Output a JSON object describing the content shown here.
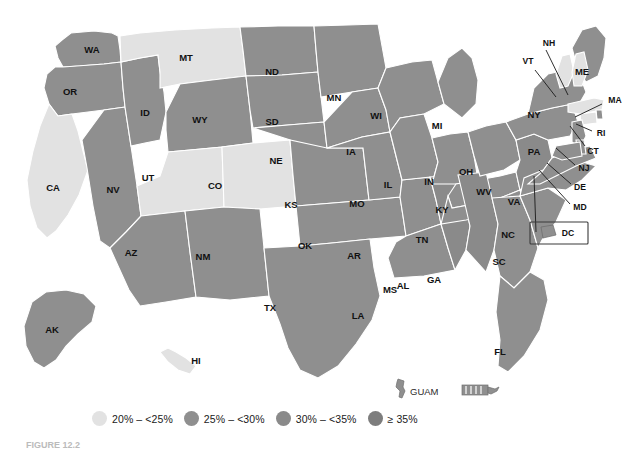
{
  "figure": {
    "type": "choropleth-map",
    "region": "United States",
    "caption": "FIGURE 12.2"
  },
  "legend": {
    "items": [
      {
        "label": "20% – <25%",
        "color": "#e2e2e2",
        "range_min": 20,
        "range_max": 25
      },
      {
        "label": "25% – <30%",
        "color": "#8f8f8f",
        "range_min": 25,
        "range_max": 30
      },
      {
        "label": "30% – <35%",
        "color": "#8a8a8a",
        "range_min": 30,
        "range_max": 35
      },
      {
        "label": "≥ 35%",
        "color": "#7d7d7d",
        "range_min": 35,
        "range_max": null
      }
    ]
  },
  "territories": [
    {
      "code": "GUAM",
      "label": "GUAM",
      "category": 2
    },
    {
      "code": "PR",
      "label": "",
      "category": 2
    }
  ],
  "chart_data": {
    "type": "map",
    "title": "",
    "value_label": "Prevalence",
    "categories": [
      "20% – <25%",
      "25% – <30%",
      "30% – <35%",
      "≥ 35%"
    ],
    "colors": [
      "#e2e2e2",
      "#8f8f8f",
      "#8a8a8a",
      "#7d7d7d"
    ],
    "states": [
      {
        "code": "WA",
        "label": "WA",
        "category": 2
      },
      {
        "code": "OR",
        "label": "OR",
        "category": 2
      },
      {
        "code": "CA",
        "label": "CA",
        "category": 1
      },
      {
        "code": "NV",
        "label": "NV",
        "category": 2
      },
      {
        "code": "ID",
        "label": "ID",
        "category": 2
      },
      {
        "code": "MT",
        "label": "MT",
        "category": 1
      },
      {
        "code": "WY",
        "label": "WY",
        "category": 2
      },
      {
        "code": "UT",
        "label": "UT",
        "category": 1
      },
      {
        "code": "CO",
        "label": "CO",
        "category": 1
      },
      {
        "code": "AZ",
        "label": "AZ",
        "category": 2
      },
      {
        "code": "NM",
        "label": "NM",
        "category": 2
      },
      {
        "code": "ND",
        "label": "ND",
        "category": 2
      },
      {
        "code": "SD",
        "label": "SD",
        "category": 2
      },
      {
        "code": "NE",
        "label": "NE",
        "category": 2
      },
      {
        "code": "KS",
        "label": "KS",
        "category": 2
      },
      {
        "code": "OK",
        "label": "OK",
        "category": 2
      },
      {
        "code": "TX",
        "label": "TX",
        "category": 2
      },
      {
        "code": "MN",
        "label": "MN",
        "category": 2
      },
      {
        "code": "IA",
        "label": "IA",
        "category": 2
      },
      {
        "code": "MO",
        "label": "MO",
        "category": 2
      },
      {
        "code": "AR",
        "label": "AR",
        "category": 2
      },
      {
        "code": "LA",
        "label": "LA",
        "category": 2
      },
      {
        "code": "WI",
        "label": "WI",
        "category": 2
      },
      {
        "code": "IL",
        "label": "IL",
        "category": 2
      },
      {
        "code": "MS",
        "label": "MS",
        "category": 3
      },
      {
        "code": "MI",
        "label": "MI",
        "category": 2
      },
      {
        "code": "IN",
        "label": "IN",
        "category": 2
      },
      {
        "code": "KY",
        "label": "KY",
        "category": 2
      },
      {
        "code": "TN",
        "label": "TN",
        "category": 2
      },
      {
        "code": "AL",
        "label": "AL",
        "category": 3
      },
      {
        "code": "OH",
        "label": "OH",
        "category": 2
      },
      {
        "code": "WV",
        "label": "WV",
        "category": 3
      },
      {
        "code": "GA",
        "label": "GA",
        "category": 2
      },
      {
        "code": "FL",
        "label": "FL",
        "category": 2
      },
      {
        "code": "SC",
        "label": "SC",
        "category": 2
      },
      {
        "code": "NC",
        "label": "NC",
        "category": 2
      },
      {
        "code": "VA",
        "label": "VA",
        "category": 2
      },
      {
        "code": "PA",
        "label": "PA",
        "category": 2
      },
      {
        "code": "NY",
        "label": "NY",
        "category": 2
      },
      {
        "code": "ME",
        "label": "ME",
        "category": 2
      },
      {
        "code": "VT",
        "label": "VT",
        "category": 1
      },
      {
        "code": "NH",
        "label": "NH",
        "category": 1
      },
      {
        "code": "MA",
        "label": "MA",
        "category": 1
      },
      {
        "code": "RI",
        "label": "RI",
        "category": 2
      },
      {
        "code": "CT",
        "label": "CT",
        "category": 1
      },
      {
        "code": "NJ",
        "label": "NJ",
        "category": 2
      },
      {
        "code": "DE",
        "label": "DE",
        "category": 2
      },
      {
        "code": "MD",
        "label": "MD",
        "category": 2
      },
      {
        "code": "DC",
        "label": "DC",
        "category": 2
      },
      {
        "code": "AK",
        "label": "AK",
        "category": 2
      },
      {
        "code": "HI",
        "label": "HI",
        "category": 1
      }
    ]
  }
}
